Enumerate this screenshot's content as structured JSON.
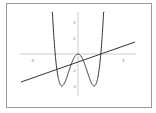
{
  "chart_data": {
    "type": "line",
    "title": "",
    "xlabel": "",
    "ylabel": "",
    "xlim": [
      -6,
      6
    ],
    "ylim": [
      -5,
      6
    ],
    "x_ticks": [
      "-4",
      "4"
    ],
    "y_ticks": [
      "4",
      "2",
      "-2",
      "-4"
    ],
    "grid": false,
    "series": [
      {
        "name": "f(x) = x^4 - 4x^2",
        "x": [
          -2.45,
          -2,
          -1.414,
          -1,
          0,
          1,
          1.414,
          2,
          2.45
        ],
        "values": [
          12,
          0,
          -4,
          -3,
          0,
          -3,
          -4,
          0,
          12
        ]
      },
      {
        "name": "g(x) = 0.5x - 1",
        "x": [
          -5,
          5
        ],
        "values": [
          -3.5,
          1.5
        ]
      }
    ]
  },
  "labels": {
    "xm4": "-4",
    "xp4": "4",
    "y4": "4",
    "y2": "2",
    "ym2": "-2",
    "ym4": "-4"
  }
}
